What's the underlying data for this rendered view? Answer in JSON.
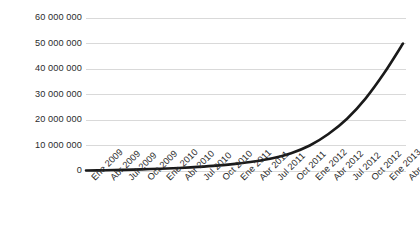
{
  "chart_data": {
    "type": "line",
    "title": "",
    "subtitle": "",
    "xlabel": "",
    "ylabel": "",
    "grid": true,
    "legend": false,
    "legend_position": "none",
    "line_color": "#1a1a1a",
    "gridline_color": "#d9d9d9",
    "background_color": "#ffffff",
    "ylim": [
      0,
      60000000
    ],
    "ytick_values": [
      60000000,
      50000000,
      40000000,
      30000000,
      20000000,
      10000000,
      0
    ],
    "ytick_labels": [
      "60 000 000",
      "50 000 000",
      "40 000 000",
      "30 000 000",
      "20 000 000",
      "10 000 000",
      "0"
    ],
    "categories": [
      "Ene 2009",
      "Abr 2009",
      "Jul 2009",
      "Oct 2009",
      "Ene 2010",
      "Abr 2010",
      "Jul 2010",
      "Oct 2010",
      "Ene 2011",
      "Abr 2011",
      "Jul 2011",
      "Oct 2011",
      "Ene 2012",
      "Abr 2012",
      "Jul 2012",
      "Oct 2012",
      "Ene 2013",
      "Abr 2013"
    ],
    "values": [
      200000,
      300000,
      450000,
      650000,
      900000,
      1200000,
      1600000,
      2100000,
      2800000,
      3700000,
      5000000,
      7000000,
      10000000,
      14500000,
      20500000,
      28500000,
      38500000,
      50000000
    ]
  }
}
